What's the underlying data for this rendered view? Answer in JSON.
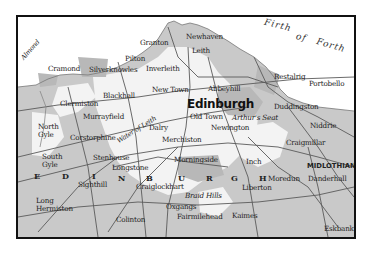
{
  "map": {
    "city_label": "Edinburgh",
    "water_label_parts": [
      "Firth",
      "of",
      "Forth"
    ],
    "region_label": "MIDLOTHIAN",
    "city_letters": [
      "E",
      "D",
      "I",
      "N",
      "B",
      "U",
      "R",
      "G",
      "H"
    ],
    "river_labels": {
      "almond": "Almond",
      "water_of_leith": "Water of Leith"
    },
    "places": {
      "granton": "Granton",
      "newhaven": "Newhaven",
      "leith": "Leith",
      "cramond": "Cramond",
      "silverknowles": "Silverknowles",
      "pilton": "Pilton",
      "inverleith": "Inverleith",
      "restalrig": "Restalrig",
      "portobello": "Portobello",
      "abbeyhill": "Abbeyhill",
      "blackhall": "Blackhall",
      "new_town": "New Town",
      "clermiston": "Clermiston",
      "murrayfield": "Murrayfield",
      "old_town": "Old Town",
      "arthurs_seat": "Arthur's Seat",
      "duddingston": "Duddingston",
      "north_gyle": "North\nGyle",
      "dalry": "Dalry",
      "newington": "Newington",
      "niddrie": "Niddrie",
      "corstorphine": "Corstorphine",
      "merchiston": "Merchiston",
      "craigmillar": "Craigmillar",
      "south_gyle": "South\nGyle",
      "stenhouse": "Stenhouse",
      "longstone": "Longstone",
      "morningside": "Morningside",
      "inch": "Inch",
      "sighthill": "Sighthill",
      "craiglockhart": "Craiglockhart",
      "liberton": "Liberton",
      "moredun": "Moredun",
      "danderhall": "Danderhall",
      "braid_hills": "Braid Hills",
      "long_hermiston": "Long\nHermiston",
      "oxgangs": "Oxgangs",
      "colinton": "Colinton",
      "fairmilehead": "Fairmilehead",
      "kaimes": "Kaimes",
      "eskbank": "Eskbank"
    },
    "colors": {
      "frame": "#111111",
      "sea": "#ffffff",
      "land_grey": "#c8c8c8",
      "built_light": "#f2f2f2",
      "roads": "#555555",
      "text": "#222222"
    }
  }
}
